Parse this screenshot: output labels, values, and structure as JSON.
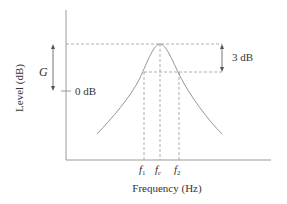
{
  "diagram": {
    "type": "bandpass-filter-response",
    "xlabel": "Frequency (Hz)",
    "ylabel": "Level (dB)",
    "zero_label": "0 dB",
    "gain_label": "G",
    "bandwidth_label": "3 dB",
    "freq_ticks": {
      "f1": {
        "base": "f",
        "sub": "1"
      },
      "fc": {
        "base": "f",
        "sub": "c"
      },
      "f2": {
        "base": "f",
        "sub": "2"
      }
    },
    "colors": {
      "axis": "#9a9a9a",
      "curve": "#8a8a8a",
      "dashed": "#9a9a9a",
      "text": "#333333"
    }
  }
}
